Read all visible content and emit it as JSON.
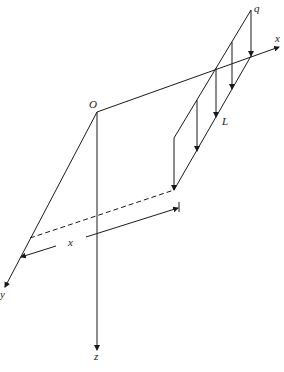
{
  "labels": {
    "origin": "O",
    "x_axis": "x",
    "y_axis": "y",
    "z_axis": "z",
    "load": "q",
    "length": "L",
    "dimension": "x"
  },
  "colors": {
    "line": "#1a1a1a",
    "background": "#ffffff"
  }
}
